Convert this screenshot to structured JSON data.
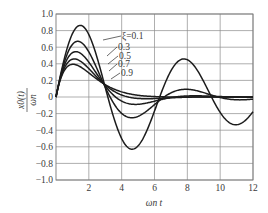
{
  "chart_data": {
    "type": "line",
    "title": "",
    "xlabel": "ωn t",
    "ylabel": "x0(t) / ωn",
    "xlim": [
      0,
      12
    ],
    "ylim": [
      -1.0,
      1.0
    ],
    "grid": true,
    "x_ticks": [
      "2",
      "4",
      "6",
      "8",
      "10",
      "12"
    ],
    "x_tick_values": [
      2,
      4,
      6,
      8,
      10,
      12
    ],
    "y_ticks": [
      "1.0",
      "0.8",
      "0.6",
      "0.4",
      "0.2",
      "0",
      "−0.2",
      "−0.4",
      "−0.6",
      "−0.8",
      "−1.0"
    ],
    "y_tick_values": [
      1.0,
      0.8,
      0.6,
      0.4,
      0.2,
      0,
      -0.2,
      -0.4,
      -0.6,
      -0.8,
      -1.0
    ],
    "legend": "inline labels with leader lines",
    "annotations": [
      {
        "text": "ξ=0.1",
        "x_px": 122,
        "y_px": 39
      },
      {
        "text": "0.3",
        "x_px": 118,
        "y_px": 50
      },
      {
        "text": "0.5",
        "x_px": 119,
        "y_px": 59
      },
      {
        "text": "0.7",
        "x_px": 118,
        "y_px": 67
      },
      {
        "text": "0.9",
        "x_px": 121,
        "y_px": 76
      }
    ],
    "x": [
      0,
      0.5,
      1.0,
      1.5,
      2.0,
      2.5,
      3.0,
      3.5,
      4.0,
      4.5,
      5.0,
      5.5,
      6.0,
      6.5,
      7.0,
      7.5,
      8.0,
      8.5,
      9.0,
      9.5,
      10.0,
      10.5,
      11.0,
      11.5,
      12.0
    ],
    "series": [
      {
        "name": "ξ=0.1",
        "zeta": 0.1,
        "values": [
          0.0,
          0.46,
          0.76,
          0.86,
          0.74,
          0.45,
          0.1,
          -0.24,
          -0.51,
          -0.63,
          -0.58,
          -0.37,
          -0.07,
          0.22,
          0.42,
          0.47,
          0.37,
          0.15,
          -0.1,
          -0.28,
          -0.37,
          -0.34,
          -0.2,
          0.0,
          0.16
        ]
      },
      {
        "name": "ξ=0.3",
        "zeta": 0.3,
        "values": [
          0.0,
          0.41,
          0.61,
          0.62,
          0.48,
          0.26,
          0.05,
          -0.11,
          -0.2,
          -0.22,
          -0.18,
          -0.11,
          -0.03,
          0.03,
          0.07,
          0.07,
          0.05,
          0.02,
          -0.01,
          -0.02,
          -0.02,
          -0.02,
          -0.01,
          0.0,
          0.0
        ]
      },
      {
        "name": "ξ=0.5",
        "zeta": 0.5,
        "values": [
          0.0,
          0.37,
          0.5,
          0.46,
          0.31,
          0.15,
          0.02,
          -0.05,
          -0.08,
          -0.08,
          -0.06,
          -0.03,
          -0.01,
          0.0,
          0.01,
          0.01,
          0.01,
          0.0,
          0.0,
          0.0,
          0.0,
          0.0,
          0.0,
          0.0,
          0.0
        ]
      },
      {
        "name": "ξ=0.7",
        "zeta": 0.7,
        "values": [
          0.0,
          0.34,
          0.41,
          0.33,
          0.2,
          0.09,
          0.02,
          -0.01,
          -0.02,
          -0.02,
          -0.01,
          -0.01,
          0.0,
          0.0,
          0.0,
          0.0,
          0.0,
          0.0,
          0.0,
          0.0,
          0.0,
          0.0,
          0.0,
          0.0,
          0.0
        ]
      },
      {
        "name": "ξ=0.9",
        "zeta": 0.9,
        "values": [
          0.0,
          0.31,
          0.34,
          0.25,
          0.14,
          0.07,
          0.03,
          0.01,
          0.0,
          0.0,
          0.0,
          0.0,
          0.0,
          0.0,
          0.0,
          0.0,
          0.0,
          0.0,
          0.0,
          0.0,
          0.0,
          0.0,
          0.0,
          0.0,
          0.0
        ]
      }
    ],
    "formula": "x0(t)/ωn = e^(−ξ ωn t) · sin(√(1−ξ²) ωn t) / √(1−ξ²)"
  },
  "labels": {
    "ylabel_num": "x0(t)",
    "ylabel_den": "ωn",
    "xlabel": "ωn t"
  }
}
